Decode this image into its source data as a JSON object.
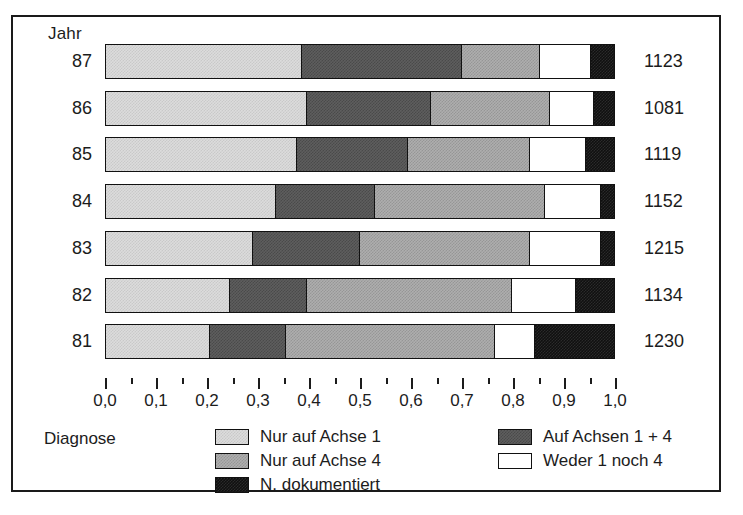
{
  "chart_data": {
    "type": "bar",
    "orientation": "horizontal",
    "stacked": true,
    "normalized": true,
    "title": "",
    "xlabel": "",
    "ylabel": "Jahr",
    "xlim": [
      0.0,
      1.0
    ],
    "grid": false,
    "legend_position": "bottom",
    "legend_title": "Diagnose",
    "axis_title_y": "Jahr",
    "categories": [
      "87",
      "86",
      "85",
      "84",
      "83",
      "82",
      "81"
    ],
    "x_tick_labels": [
      "0,0",
      "0,1",
      "0,2",
      "0,3",
      "0,4",
      "0,5",
      "0,6",
      "0,7",
      "0,8",
      "0,9",
      "1,0"
    ],
    "x_tick_values": [
      0.0,
      0.1,
      0.2,
      0.3,
      0.4,
      0.5,
      0.6,
      0.7,
      0.8,
      0.9,
      1.0
    ],
    "minor_ticks": true,
    "series": [
      {
        "name": "Nur auf Achse 1",
        "fill": "light",
        "color": "#dcdcdc",
        "values": [
          0.385,
          0.395,
          0.375,
          0.335,
          0.29,
          0.245,
          0.205
        ]
      },
      {
        "name": "Auf Achsen 1 + 4",
        "fill": "dark",
        "color": "#5e5e5e",
        "values": [
          0.315,
          0.245,
          0.22,
          0.195,
          0.21,
          0.15,
          0.15
        ]
      },
      {
        "name": "Nur auf Achse 4",
        "fill": "medium",
        "color": "#aeaeae",
        "values": [
          0.155,
          0.235,
          0.24,
          0.335,
          0.335,
          0.405,
          0.41
        ]
      },
      {
        "name": "Weder 1 noch 4",
        "fill": "white",
        "color": "#ffffff",
        "values": [
          0.1,
          0.085,
          0.11,
          0.11,
          0.14,
          0.125,
          0.08
        ]
      },
      {
        "name": "N. dokumentiert",
        "fill": "black",
        "color": "#101010",
        "values": [
          0.045,
          0.04,
          0.055,
          0.025,
          0.025,
          0.075,
          0.155
        ]
      }
    ],
    "row_totals": [
      1123,
      1081,
      1119,
      1152,
      1215,
      1134,
      1230
    ],
    "cumulative_boundaries": [
      [
        0.385,
        0.7,
        0.855,
        0.955
      ],
      [
        0.395,
        0.64,
        0.875,
        0.96
      ],
      [
        0.375,
        0.595,
        0.835,
        0.945
      ],
      [
        0.335,
        0.53,
        0.865,
        0.975
      ],
      [
        0.29,
        0.5,
        0.835,
        0.975
      ],
      [
        0.245,
        0.395,
        0.8,
        0.925
      ],
      [
        0.205,
        0.355,
        0.765,
        0.845
      ]
    ]
  },
  "axis": {
    "y_title": "Jahr",
    "year_labels": [
      "87",
      "86",
      "85",
      "84",
      "83",
      "82",
      "81"
    ],
    "totals": [
      "1123",
      "1081",
      "1119",
      "1152",
      "1215",
      "1134",
      "1230"
    ],
    "x_labels": [
      "0,0",
      "0,1",
      "0,2",
      "0,3",
      "0,4",
      "0,5",
      "0,6",
      "0,7",
      "0,8",
      "0,9",
      "1,0"
    ]
  },
  "legend": {
    "title": "Diagnose",
    "column_1": [
      {
        "label": "Nur auf Achse 1",
        "fill": "light"
      },
      {
        "label": "Nur auf Achse 4",
        "fill": "medium"
      },
      {
        "label": "N. dokumentiert",
        "fill": "black"
      }
    ],
    "column_2": [
      {
        "label": "Auf Achsen 1 + 4",
        "fill": "dark"
      },
      {
        "label": "Weder 1 noch 4",
        "fill": "white"
      }
    ]
  },
  "colors": {
    "light": "#dcdcdc",
    "medium": "#aeaeae",
    "dark": "#5e5e5e",
    "white": "#ffffff",
    "black": "#101010",
    "ink": "#1c1c1c"
  }
}
